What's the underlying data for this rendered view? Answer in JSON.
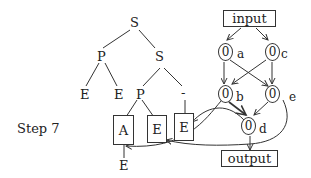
{
  "step_label": "Step 7",
  "tree": {
    "root": "S",
    "left_child": "P",
    "right_child": "S",
    "left_p_children": [
      "E",
      "E"
    ],
    "inner_p": "P",
    "inner_dash": "-",
    "boxes": [
      "A",
      "E",
      "E"
    ],
    "below_a": "E"
  },
  "graph": {
    "input_label": "input",
    "output_label": "output",
    "nodes": [
      {
        "id": "a",
        "value": "0",
        "label": "a"
      },
      {
        "id": "c",
        "value": "0",
        "label": "c"
      },
      {
        "id": "b",
        "value": "0",
        "label": "b"
      },
      {
        "id": "e",
        "value": "0",
        "label": "e"
      },
      {
        "id": "d",
        "value": "0",
        "label": "d"
      }
    ]
  }
}
